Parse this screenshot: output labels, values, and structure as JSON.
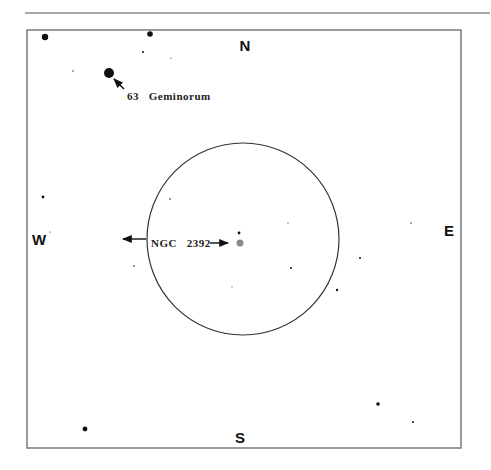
{
  "chart": {
    "cardinals": {
      "north": {
        "label": "N",
        "x": 245,
        "y": 51
      },
      "south": {
        "label": "S",
        "x": 240,
        "y": 443
      },
      "west": {
        "label": "W",
        "x": 39,
        "y": 245
      },
      "east": {
        "label": "E",
        "x": 449,
        "y": 236
      }
    },
    "labels": {
      "geminorum": {
        "text": "63   Geminorum",
        "x": 127,
        "y": 100
      },
      "ngc": {
        "text": "NGC   2392",
        "x": 151,
        "y": 247
      }
    },
    "field_of_view": {
      "cx": 243,
      "cy": 239,
      "r": 96
    },
    "nebula": {
      "name": "NGC 2392",
      "cx": 240,
      "cy": 243,
      "r": 3.5,
      "color": "#8a8a8a"
    },
    "stars": [
      {
        "cx": 45,
        "cy": 37,
        "r": 3.2
      },
      {
        "cx": 150,
        "cy": 34,
        "r": 2.8
      },
      {
        "cx": 109,
        "cy": 73,
        "r": 5
      },
      {
        "cx": 143,
        "cy": 52,
        "r": 1
      },
      {
        "cx": 73,
        "cy": 71,
        "r": 0.7
      },
      {
        "cx": 171,
        "cy": 58,
        "r": 0.6
      },
      {
        "cx": 43,
        "cy": 197,
        "r": 1.4
      },
      {
        "cx": 50,
        "cy": 232,
        "r": 0.6
      },
      {
        "cx": 134,
        "cy": 266,
        "r": 0.8
      },
      {
        "cx": 170,
        "cy": 199,
        "r": 0.8
      },
      {
        "cx": 239,
        "cy": 233,
        "r": 1.4
      },
      {
        "cx": 288,
        "cy": 223,
        "r": 0.6
      },
      {
        "cx": 291,
        "cy": 268,
        "r": 1
      },
      {
        "cx": 232,
        "cy": 287,
        "r": 0.5
      },
      {
        "cx": 337,
        "cy": 290,
        "r": 1.2
      },
      {
        "cx": 360,
        "cy": 258,
        "r": 1
      },
      {
        "cx": 411,
        "cy": 223,
        "r": 0.7
      },
      {
        "cx": 85,
        "cy": 429,
        "r": 2.4
      },
      {
        "cx": 378,
        "cy": 404,
        "r": 1.8
      },
      {
        "cx": 413,
        "cy": 422,
        "r": 1
      }
    ]
  }
}
